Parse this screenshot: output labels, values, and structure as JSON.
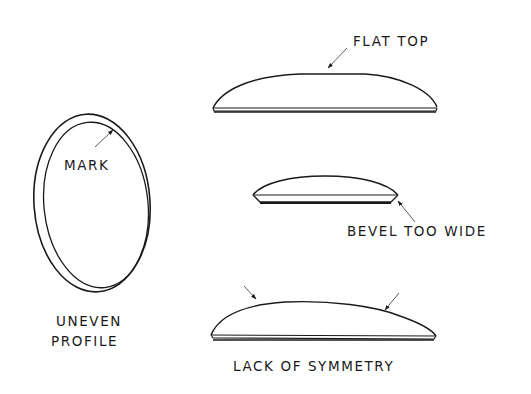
{
  "diagram": {
    "panels": [
      {
        "id": "uneven-profile",
        "caption_lines": [
          "UNEVEN",
          "PROFILE"
        ],
        "callout": "MARK"
      },
      {
        "id": "flat-top",
        "callout": "FLAT TOP"
      },
      {
        "id": "bevel-too-wide",
        "callout": "BEVEL TOO WIDE"
      },
      {
        "id": "lack-of-symmetry",
        "caption": "LACK OF SYMMETRY"
      }
    ],
    "colors": {
      "ink": "#1a1a1a",
      "background": "#ffffff"
    }
  }
}
